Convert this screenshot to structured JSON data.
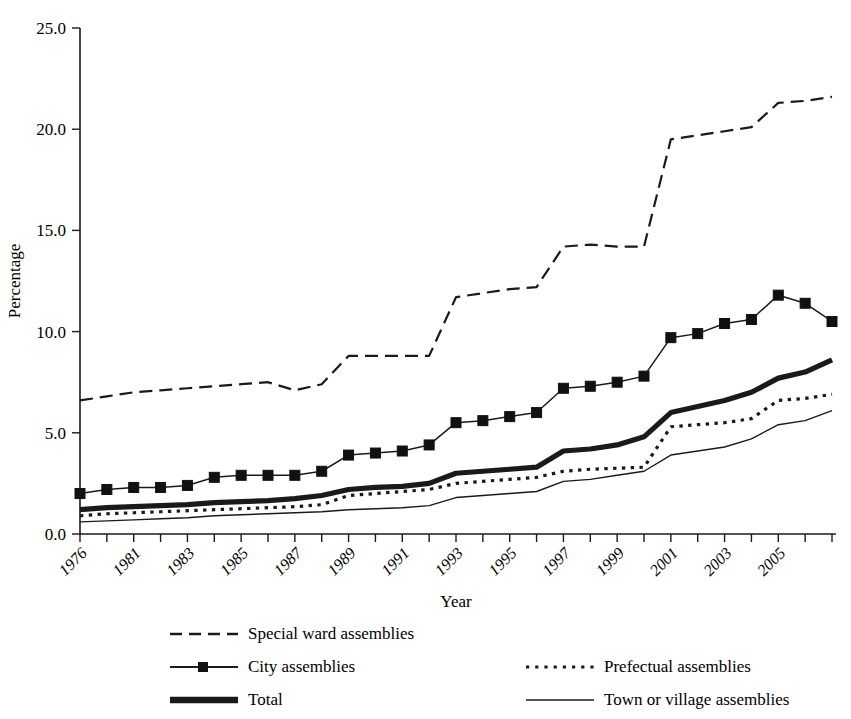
{
  "chart_data": {
    "type": "line",
    "title": "",
    "xlabel": "Year",
    "ylabel": "Percentage",
    "ylim": [
      0.0,
      25.0
    ],
    "yticks": [
      "0.0",
      "5.0",
      "10.0",
      "15.0",
      "20.0",
      "25.0"
    ],
    "ytick_values": [
      0.0,
      5.0,
      10.0,
      15.0,
      20.0,
      25.0
    ],
    "grid": false,
    "legend_position": "below-plot-two-columns",
    "x": [
      1976,
      1979,
      1980,
      1981,
      1982,
      1983,
      1984,
      1985,
      1986,
      1987,
      1988,
      1989,
      1990,
      1991,
      1992,
      1993,
      1994,
      1995,
      1996,
      1997,
      1998,
      1999,
      2000,
      2001,
      2002,
      2003,
      2004,
      2005,
      2006
    ],
    "xtick_labels": [
      "1976",
      "",
      "1981",
      "",
      "1983",
      "",
      "1985",
      "",
      "1987",
      "",
      "1989",
      "",
      "1991",
      "",
      "1993",
      "",
      "1995",
      "",
      "1997",
      "",
      "1999",
      "",
      "2001",
      "",
      "2003",
      "",
      "2005",
      "",
      ""
    ],
    "xtick_labels_shown": [
      "1976",
      "1981",
      "1983",
      "1985",
      "1987",
      "1989",
      "1991",
      "1993",
      "1995",
      "1997",
      "1999",
      "2001",
      "2003",
      "2005"
    ],
    "series": [
      {
        "name": "Special ward assemblies",
        "style": "dashed",
        "marker": "none",
        "values": [
          6.6,
          6.8,
          7.0,
          7.1,
          7.2,
          7.3,
          7.4,
          7.5,
          7.1,
          7.4,
          8.8,
          8.8,
          8.8,
          8.8,
          11.7,
          11.9,
          12.1,
          12.2,
          14.2,
          14.3,
          14.2,
          14.2,
          19.5,
          19.7,
          19.9,
          20.1,
          21.3,
          21.4,
          21.6
        ]
      },
      {
        "name": "City assemblies",
        "style": "solid-thin-marker",
        "marker": "square",
        "values": [
          2.0,
          2.2,
          2.3,
          2.3,
          2.4,
          2.8,
          2.9,
          2.9,
          2.9,
          3.1,
          3.9,
          4.0,
          4.1,
          4.4,
          5.5,
          5.6,
          5.8,
          6.0,
          7.2,
          7.3,
          7.5,
          7.8,
          9.7,
          9.9,
          10.4,
          10.6,
          11.8,
          11.4,
          10.5
        ]
      },
      {
        "name": "Total",
        "style": "solid-thick",
        "marker": "none",
        "values": [
          1.2,
          1.3,
          1.35,
          1.4,
          1.45,
          1.55,
          1.6,
          1.65,
          1.75,
          1.9,
          2.2,
          2.3,
          2.35,
          2.5,
          3.0,
          3.1,
          3.2,
          3.3,
          4.1,
          4.2,
          4.4,
          4.8,
          6.0,
          6.3,
          6.6,
          7.0,
          7.7,
          8.0,
          8.6
        ]
      },
      {
        "name": "Prefectual assemblies",
        "style": "dotted",
        "marker": "none",
        "values": [
          0.9,
          1.0,
          1.05,
          1.1,
          1.15,
          1.2,
          1.25,
          1.3,
          1.35,
          1.45,
          1.9,
          2.0,
          2.1,
          2.2,
          2.5,
          2.6,
          2.7,
          2.8,
          3.1,
          3.2,
          3.25,
          3.3,
          5.3,
          5.4,
          5.5,
          5.7,
          6.6,
          6.7,
          6.9
        ]
      },
      {
        "name": "Town or village assemblies",
        "style": "solid-thin",
        "marker": "none",
        "values": [
          0.6,
          0.65,
          0.7,
          0.75,
          0.8,
          0.9,
          0.95,
          1.0,
          1.05,
          1.1,
          1.2,
          1.25,
          1.3,
          1.4,
          1.8,
          1.9,
          2.0,
          2.1,
          2.6,
          2.7,
          2.9,
          3.1,
          3.9,
          4.1,
          4.3,
          4.7,
          5.4,
          5.6,
          6.1
        ]
      }
    ]
  },
  "axes": {
    "y_title": "Percentage",
    "x_title": "Year"
  },
  "legend": {
    "left_column": [
      {
        "label": "Special ward assemblies",
        "swatch": "dashed-line-swatch"
      },
      {
        "label": "City assemblies",
        "swatch": "line-with-square-marker-swatch"
      },
      {
        "label": "Total",
        "swatch": "thick-line-swatch"
      }
    ],
    "right_column": [
      {
        "label": "Prefectual assemblies",
        "swatch": "dotted-line-swatch"
      },
      {
        "label": "Town or village assemblies",
        "swatch": "thin-line-swatch"
      }
    ]
  },
  "colors": {
    "ink": "#1a1a1a",
    "background": "#ffffff"
  }
}
